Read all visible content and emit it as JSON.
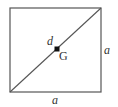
{
  "diagram": {
    "type": "geometry",
    "shape": "square",
    "stroke_color": "#555555",
    "point_color": "#111111",
    "square": {
      "x": 10,
      "y": 8,
      "width": 91,
      "height": 84
    },
    "diagonal": {
      "x1": 10,
      "y1": 92,
      "x2": 101,
      "y2": 8
    },
    "centroid": {
      "x": 57,
      "y": 49,
      "size": 5
    },
    "labels": {
      "diagonal": "d",
      "centroid": "G",
      "right_side": "a",
      "bottom_side": "a"
    },
    "label_positions": {
      "diagonal": {
        "x": 47,
        "y": 45
      },
      "centroid": {
        "x": 59,
        "y": 60
      },
      "right_side": {
        "x": 104,
        "y": 54
      },
      "bottom_side": {
        "x": 52,
        "y": 104
      }
    }
  }
}
